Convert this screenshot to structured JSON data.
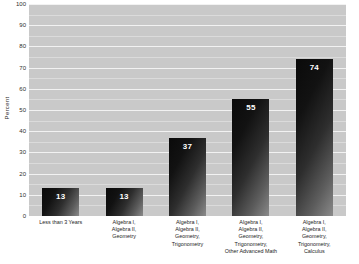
{
  "chart_data": {
    "type": "bar",
    "title": "",
    "xlabel": "",
    "ylabel": "Percent",
    "ylim": [
      0,
      100
    ],
    "ytick_step": 10,
    "grid": true,
    "legend": null,
    "categories": [
      "Less than 3 Years",
      "Algebra I, Algebra II, Geometry",
      "Algebra I, Algebra II, Geometry, Trigonometry",
      "Algebra I, Algebra II, Geometry, Trigonometry, Other Advanced Math",
      "Algebra I, Algebra II, Geometry, Trigonometry, Calculus"
    ],
    "category_lines": [
      [
        "Less than 3 Years"
      ],
      [
        "Algebra I,",
        "Algebra II,",
        "Geometry"
      ],
      [
        "Algebra I,",
        "Algebra II,",
        "Geometry,",
        "Trigonometry"
      ],
      [
        "Algebra I,",
        "Algebra II,",
        "Geometry,",
        "Trigonometry,",
        "Other Advanced Math"
      ],
      [
        "Algebra I,",
        "Algebra II,",
        "Geometry,",
        "Trigonometry,",
        "Calculus"
      ]
    ],
    "values": [
      13,
      13,
      37,
      55,
      74
    ],
    "value_labels": [
      "13",
      "13",
      "37",
      "55",
      "74"
    ],
    "yticks": [
      "0",
      "10",
      "20",
      "30",
      "40",
      "50",
      "60",
      "70",
      "80",
      "90",
      "100"
    ],
    "colors": {
      "plot_background": "#c9c9c9",
      "gridline": "#f2f2f2",
      "bar_dark": "#0a0a0a",
      "bar_light": "#8a8a8a",
      "value_text": "#ffffff",
      "axis_text": "#2e2e2e",
      "page_background": "#ffffff"
    }
  }
}
